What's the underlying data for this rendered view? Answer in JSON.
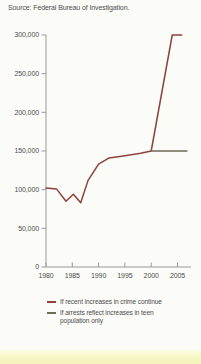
{
  "source": "Source: Federal Bureau of Investigation.",
  "colors": {
    "line_projection_crime": "#8e413d",
    "line_projection_population": "#6f6b56",
    "axis": "#9a9a9a",
    "text": "#4d4d4d",
    "background": "#fbfbf8",
    "bottom_band": "#f6f6c2"
  },
  "chart_data": {
    "type": "line",
    "title": "",
    "xlabel": "",
    "ylabel": "",
    "xlim": [
      1980,
      2007
    ],
    "ylim": [
      0,
      300000
    ],
    "grid": false,
    "legend_position": "bottom",
    "xticks": [
      {
        "value": 1980,
        "label": "1980"
      },
      {
        "value": 1985,
        "label": "1985"
      },
      {
        "value": 1990,
        "label": "1990"
      },
      {
        "value": 1995,
        "label": "1995"
      },
      {
        "value": 2000,
        "label": "2000"
      },
      {
        "value": 2005,
        "label": "2005"
      }
    ],
    "yticks": [
      {
        "value": 0,
        "label": "0"
      },
      {
        "value": 50000,
        "label": "50,000"
      },
      {
        "value": 100000,
        "label": "100,000"
      },
      {
        "value": 150000,
        "label": "150,000"
      },
      {
        "value": 200000,
        "label": "200,000"
      },
      {
        "value": 250000,
        "label": "250,000"
      },
      {
        "value": 300000,
        "label": "300,000"
      }
    ],
    "series": [
      {
        "name": "If recent increases in crime continue",
        "color": "#8e413d",
        "points": [
          [
            1980,
            102000
          ],
          [
            1982,
            101000
          ],
          [
            1983.8,
            85000
          ],
          [
            1985.2,
            94000
          ],
          [
            1986.6,
            83000
          ],
          [
            1988,
            112000
          ],
          [
            1990,
            133000
          ],
          [
            1992,
            141000
          ],
          [
            1995,
            144000
          ],
          [
            1998,
            147000
          ],
          [
            2000,
            150000
          ],
          [
            2004,
            300000
          ],
          [
            2005.8,
            300000
          ]
        ]
      },
      {
        "name": "If arrests reflect increases in teen population only",
        "color": "#6f6b56",
        "points": [
          [
            2000,
            150000
          ],
          [
            2006.8,
            150000
          ]
        ]
      }
    ]
  }
}
